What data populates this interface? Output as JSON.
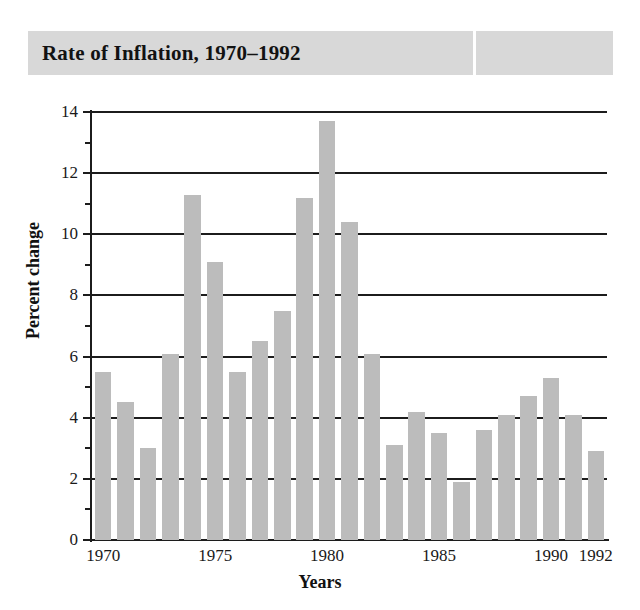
{
  "title": "Rate of Inflation, 1970–1992",
  "chart_data": {
    "type": "bar",
    "title": "Rate of Inflation, 1970–1992",
    "xlabel": "Years",
    "ylabel": "Percent change",
    "ylim": [
      0,
      14
    ],
    "xlim": [
      1969.5,
      1992.5
    ],
    "grid": true,
    "legend": "none",
    "bar_color": "#bcbcbc",
    "axis_color": "#1c1c1c",
    "banner_color": "#d8d8d8",
    "ytick_labels": [
      "0",
      "2",
      "4",
      "6",
      "8",
      "10",
      "12",
      "14"
    ],
    "ytick_values": [
      0,
      2,
      4,
      6,
      8,
      10,
      12,
      14
    ],
    "yminor_values": [
      1,
      3,
      5,
      7,
      9,
      11,
      13
    ],
    "xtick_labels": [
      "1970",
      "1975",
      "1980",
      "1985",
      "1990",
      "1992"
    ],
    "xtick_values": [
      1970,
      1975,
      1980,
      1985,
      1990,
      1992
    ],
    "categories": [
      1970,
      1971,
      1972,
      1973,
      1974,
      1975,
      1976,
      1977,
      1978,
      1979,
      1980,
      1981,
      1982,
      1983,
      1984,
      1985,
      1986,
      1987,
      1988,
      1989,
      1990,
      1991,
      1992
    ],
    "values": [
      5.5,
      4.5,
      3.0,
      6.1,
      11.3,
      9.1,
      5.5,
      6.5,
      7.5,
      11.2,
      13.7,
      10.4,
      6.1,
      3.1,
      4.2,
      3.5,
      1.9,
      3.6,
      4.1,
      4.7,
      5.3,
      4.1,
      2.9
    ]
  }
}
